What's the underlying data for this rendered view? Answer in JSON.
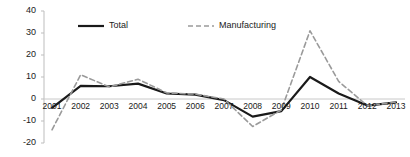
{
  "chart_data": {
    "type": "line",
    "title": "",
    "subtitle": "",
    "xlabel": "",
    "ylabel": "",
    "categories": [
      "2001",
      "2002",
      "2003",
      "2004",
      "2005",
      "2006",
      "2007",
      "2008",
      "2009",
      "2010",
      "2011",
      "2012",
      "2013"
    ],
    "x": [
      2001,
      2002,
      2003,
      2004,
      2005,
      2006,
      2007,
      2008,
      2009,
      2010,
      2011,
      2012,
      2013
    ],
    "ylim": [
      -20,
      40
    ],
    "yticks": [
      40,
      30,
      20,
      10,
      0,
      -10,
      -20
    ],
    "ytick_labels": [
      "40",
      "30",
      "20",
      "10",
      "0",
      "-10",
      "-20"
    ],
    "grid": false,
    "zero_line": true,
    "legend_position": "top-center",
    "series": [
      {
        "name": "Total",
        "style": "solid",
        "color": "#1a1a1a",
        "width": 2.2,
        "values": [
          -4,
          6,
          5.8,
          7,
          2.5,
          2,
          -0.5,
          -8,
          -5.5,
          10,
          2.5,
          -3,
          -1.5
        ]
      },
      {
        "name": "Manufacturing",
        "style": "dashed",
        "color": "#9a9a9a",
        "width": 1.6,
        "values": [
          -14,
          11,
          5.5,
          9,
          2.8,
          2.2,
          0,
          -12.5,
          -5,
          31,
          8,
          -3,
          -1.5
        ]
      }
    ],
    "legend": [
      {
        "label": "Total",
        "style": "solid",
        "color": "#1a1a1a"
      },
      {
        "label": "Manufacturing",
        "style": "dashed",
        "color": "#9a9a9a"
      }
    ],
    "axis_color": "#bdbdbd",
    "zero_line_color": "#c8c8c8",
    "text_color": "#1a1a1a",
    "background": "#ffffff"
  }
}
